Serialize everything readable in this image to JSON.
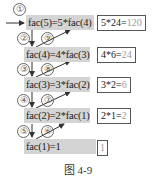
{
  "diagram": {
    "calls": [
      {
        "label": "fac(5)=5*fac(4)"
      },
      {
        "label": "fac(4)=4*fac(3)"
      },
      {
        "label": "fac(3)=3*fac(2)"
      },
      {
        "label": "fac(2)=2*fac(1)"
      },
      {
        "label": "fac(1)=1"
      }
    ],
    "results": [
      {
        "expr": "5*24=",
        "value": "120"
      },
      {
        "expr": "4*6=",
        "value": "24"
      },
      {
        "expr": "3*2=",
        "value": "6"
      },
      {
        "expr": "2*1=",
        "value": "2"
      },
      {
        "expr": "",
        "value": "1"
      }
    ],
    "step_numbers": [
      "①",
      "②",
      "③",
      "④",
      "⑤",
      "⑥",
      "⑦",
      "⑧",
      "⑨"
    ],
    "caption": "图 4-9",
    "colors": {
      "call_box": "#d4d4d4",
      "result_value": "#9a9a9a",
      "border": "#555555"
    }
  }
}
